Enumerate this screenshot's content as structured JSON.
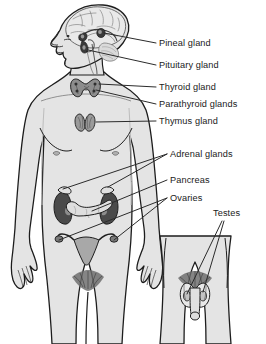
{
  "diagram": {
    "body_fill": "#e4e4e4",
    "body_shade": "#d2d2d2",
    "outline": "#1d1d1d",
    "organ_dark": "#4a4a4a",
    "organ_mid": "#8d8d8d",
    "organ_light": "#b9b9b9",
    "leader_color": "#2b2b2b",
    "labels": [
      {
        "id": "pineal",
        "text": "Pineal gland",
        "x": 159,
        "y": 46
      },
      {
        "id": "pituitary",
        "text": "Pituitary gland",
        "x": 159,
        "y": 68
      },
      {
        "id": "thyroid",
        "text": "Thyroid gland",
        "x": 159,
        "y": 90
      },
      {
        "id": "parathyroid",
        "text": "Parathyroid glands",
        "x": 159,
        "y": 107
      },
      {
        "id": "thymus",
        "text": "Thymus gland",
        "x": 159,
        "y": 124
      },
      {
        "id": "adrenal",
        "text": "Adrenal glands",
        "x": 170,
        "y": 157
      },
      {
        "id": "pancreas",
        "text": "Pancreas",
        "x": 170,
        "y": 183
      },
      {
        "id": "ovaries",
        "text": "Ovaries",
        "x": 170,
        "y": 201
      },
      {
        "id": "testes",
        "text": "Testes",
        "x": 213,
        "y": 216
      }
    ],
    "figures": [
      {
        "id": "female-full-body",
        "name": "female figure, anterior view with head in left profile"
      },
      {
        "id": "male-pelvis-inset",
        "name": "male pelvis inset, anterior view"
      }
    ],
    "organs": [
      {
        "id": "pineal-gland",
        "region": "brain"
      },
      {
        "id": "pituitary-gland",
        "region": "brain"
      },
      {
        "id": "thyroid-gland",
        "region": "neck"
      },
      {
        "id": "parathyroid-glands",
        "region": "neck"
      },
      {
        "id": "thymus-gland",
        "region": "upper chest"
      },
      {
        "id": "adrenal-glands",
        "region": "atop kidneys"
      },
      {
        "id": "pancreas",
        "region": "abdomen"
      },
      {
        "id": "ovaries",
        "region": "pelvis"
      },
      {
        "id": "testes",
        "region": "male pelvis inset"
      }
    ]
  }
}
